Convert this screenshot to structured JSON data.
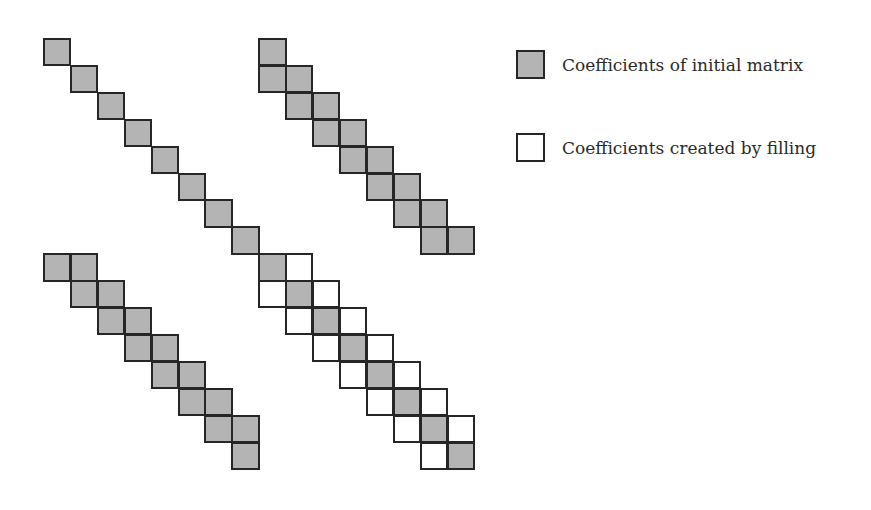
{
  "diagram": {
    "type": "sparse-matrix-fill-in",
    "matrix_size": 16,
    "grid": {
      "origin_x": 43,
      "origin_y": 38,
      "cell_size": 26.9
    },
    "colors": {
      "initial": "#b4b4b4",
      "fill": "#ffffff",
      "border": "#262626"
    },
    "initial_cells": [
      [
        0,
        0
      ],
      [
        1,
        1
      ],
      [
        2,
        2
      ],
      [
        3,
        3
      ],
      [
        4,
        4
      ],
      [
        5,
        5
      ],
      [
        6,
        6
      ],
      [
        7,
        7
      ],
      [
        0,
        8
      ],
      [
        1,
        8
      ],
      [
        1,
        9
      ],
      [
        2,
        9
      ],
      [
        2,
        10
      ],
      [
        3,
        10
      ],
      [
        3,
        11
      ],
      [
        4,
        11
      ],
      [
        4,
        12
      ],
      [
        5,
        12
      ],
      [
        5,
        13
      ],
      [
        6,
        13
      ],
      [
        6,
        14
      ],
      [
        7,
        14
      ],
      [
        7,
        15
      ],
      [
        8,
        0
      ],
      [
        8,
        1
      ],
      [
        9,
        1
      ],
      [
        9,
        2
      ],
      [
        10,
        2
      ],
      [
        10,
        3
      ],
      [
        11,
        3
      ],
      [
        11,
        4
      ],
      [
        12,
        4
      ],
      [
        12,
        5
      ],
      [
        13,
        5
      ],
      [
        13,
        6
      ],
      [
        14,
        6
      ],
      [
        14,
        7
      ],
      [
        15,
        7
      ],
      [
        8,
        8
      ],
      [
        9,
        9
      ],
      [
        10,
        10
      ],
      [
        11,
        11
      ],
      [
        12,
        12
      ],
      [
        13,
        13
      ],
      [
        14,
        14
      ],
      [
        15,
        15
      ]
    ],
    "fill_cells": [
      [
        8,
        9
      ],
      [
        9,
        8
      ],
      [
        9,
        10
      ],
      [
        10,
        9
      ],
      [
        10,
        11
      ],
      [
        11,
        10
      ],
      [
        11,
        12
      ],
      [
        12,
        11
      ],
      [
        12,
        13
      ],
      [
        13,
        12
      ],
      [
        13,
        14
      ],
      [
        14,
        13
      ],
      [
        14,
        15
      ],
      [
        15,
        14
      ]
    ]
  },
  "legend": [
    {
      "kind": "initial",
      "label": "Coefficients of initial matrix",
      "y": 50
    },
    {
      "kind": "fill",
      "label": "Coefficients created by filling",
      "y": 133
    }
  ]
}
